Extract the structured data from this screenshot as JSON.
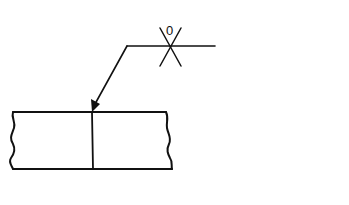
{
  "diagram": {
    "type": "welding-symbol",
    "symbol": {
      "label": "0",
      "description": "Square butt weld symbol with root gap 0, crossing reference line"
    },
    "colors": {
      "line": "#111111",
      "background": "#ffffff"
    },
    "parts": {
      "reference_line": "horizontal reference line",
      "leader_arrow": "arrow pointing to joint",
      "plates": "two plates butt-jointed with break lines at ends"
    }
  }
}
